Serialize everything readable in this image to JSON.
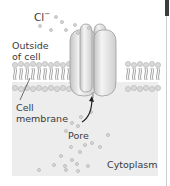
{
  "figure": {
    "labels": {
      "ion": "Cl",
      "ion_charge": "−",
      "outside": "Outside",
      "outside_line2": "of cell",
      "membrane": "Cell",
      "membrane_line2": "membrane",
      "pore": "Pore",
      "cytoplasm": "Cytoplasm"
    },
    "colors": {
      "background": "#ffffff",
      "cytoplasm": "#ededed",
      "protein": "#e4e4e4",
      "protein_shade": "#bdbdbd",
      "lipid_head": "#d6d6d6",
      "lipid_tail": "#8a8a8a",
      "ion_dot": "#cfcfcf",
      "text": "#3a3a3a"
    }
  }
}
